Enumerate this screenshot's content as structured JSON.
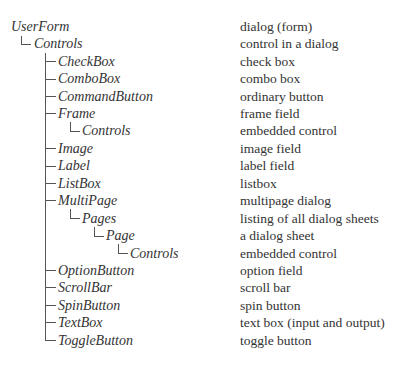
{
  "tree": [
    {
      "name": "UserForm",
      "level": 0,
      "description": "dialog (form)"
    },
    {
      "name": "Controls",
      "level": 1,
      "description": "control in a dialog"
    },
    {
      "name": "CheckBox",
      "level": 2,
      "description": "check box"
    },
    {
      "name": "ComboBox",
      "level": 2,
      "description": "combo box"
    },
    {
      "name": "CommandButton",
      "level": 2,
      "description": "ordinary button"
    },
    {
      "name": "Frame",
      "level": 2,
      "description": "frame field"
    },
    {
      "name": "Controls",
      "level": 3,
      "description": "embedded control"
    },
    {
      "name": "Image",
      "level": 2,
      "description": "image field"
    },
    {
      "name": "Label",
      "level": 2,
      "description": "label field"
    },
    {
      "name": "ListBox",
      "level": 2,
      "description": "listbox"
    },
    {
      "name": "MultiPage",
      "level": 2,
      "description": "multipage dialog"
    },
    {
      "name": "Pages",
      "level": 3,
      "description": "listing of all dialog sheets"
    },
    {
      "name": "Page",
      "level": 4,
      "description": "a dialog sheet"
    },
    {
      "name": "Controls",
      "level": 5,
      "description": "embedded control"
    },
    {
      "name": "OptionButton",
      "level": 2,
      "description": "option field"
    },
    {
      "name": "ScrollBar",
      "level": 2,
      "description": "scroll bar"
    },
    {
      "name": "SpinButton",
      "level": 2,
      "description": "spin button"
    },
    {
      "name": "TextBox",
      "level": 2,
      "description": "text box (input and output)"
    },
    {
      "name": "ToggleButton",
      "level": 2,
      "description": "toggle button"
    }
  ]
}
